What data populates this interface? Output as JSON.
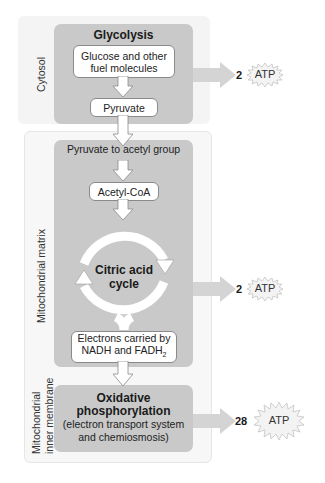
{
  "regions": {
    "cytosol": "Cytosol",
    "matrix": "Mitochondrial matrix",
    "inner_membrane_line1": "Mitochondrial",
    "inner_membrane_line2": "inner membrane"
  },
  "glycolysis": {
    "title": "Glycolysis",
    "input_line1": "Glucose and other",
    "input_line2": "fuel molecules",
    "output": "Pyruvate"
  },
  "citric_acid": {
    "header": "Pyruvate to acetyl group",
    "acetyl": "Acetyl-CoA",
    "cycle_line1": "Citric acid",
    "cycle_line2": "cycle",
    "electrons_line1": "Electrons carried by",
    "electrons_line2": "NADH and FADH",
    "electrons_sub": "2"
  },
  "oxidative": {
    "title_line1": "Oxidative",
    "title_line2": "phosphorylation",
    "desc_line1": "(electron transport system",
    "desc_line2": "and chemiosmosis)"
  },
  "atp_yields": [
    {
      "count": "2",
      "label": "ATP",
      "stage": "glycolysis"
    },
    {
      "count": "2",
      "label": "ATP",
      "stage": "citric acid cycle"
    },
    {
      "count": "28",
      "label": "ATP",
      "stage": "oxidative phosphorylation"
    }
  ],
  "colors": {
    "stage_fill": "#c9c9c9",
    "region_fill": "#f4f4f4",
    "arrow_fill": "#d4d4d4",
    "box_fill": "#ffffff",
    "box_stroke": "#8a8a8a"
  }
}
